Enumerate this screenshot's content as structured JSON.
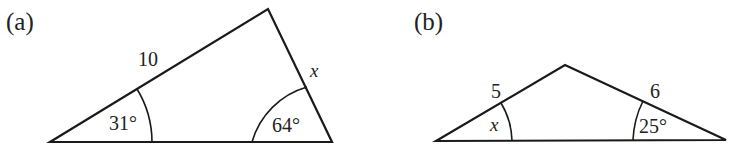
{
  "figures": [
    {
      "label": "(a)",
      "side_label": "10",
      "unknown_label": "x",
      "angle_left": "31°",
      "angle_right": "64°"
    },
    {
      "label": "(b)",
      "side_left_label": "5",
      "side_right_label": "6",
      "angle_left": "x",
      "angle_right": "25°"
    }
  ],
  "colors": {
    "stroke": "#1a1a1a",
    "text": "#222222",
    "background": "#ffffff"
  }
}
